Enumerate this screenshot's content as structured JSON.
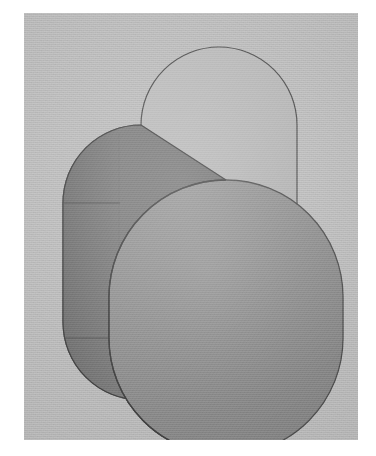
{
  "figure": {
    "shape_name": "stadium-prism",
    "projection": "axonometric",
    "canvas": {
      "width": 376,
      "height": 456
    },
    "page_background": "#ffffff",
    "plate": {
      "name": "scan-plate",
      "left": 24,
      "top": 13,
      "width": 334,
      "height": 427,
      "background_color": "#bdbdbd"
    },
    "faces": [
      {
        "id": "top-back-face",
        "label": "Back / top stadium face",
        "fill": "#b4b4b4",
        "stroke": "#4a4a4a",
        "stroke_width": 1.2
      },
      {
        "id": "side-face",
        "label": "Extruded side wall",
        "fill": "#757575",
        "stroke": "#3e3e3e",
        "stroke_width": 1.2
      },
      {
        "id": "front-face",
        "label": "Front stadium face",
        "fill": "#8a8a8a",
        "stroke": "#464646",
        "stroke_width": 1.3
      }
    ],
    "seams": [
      {
        "id": "upper-tangent-seam",
        "label": "Upper arc-to-straight tangent line",
        "stroke": "#4f4f4f"
      },
      {
        "id": "lower-tangent-seam",
        "label": "Lower arc-to-straight tangent line",
        "stroke": "#4f4f4f"
      },
      {
        "id": "silhouette-seam",
        "label": "Silhouette edge between side wall and front face",
        "stroke": "#3f3f3f"
      }
    ],
    "geometry": {
      "front_face": {
        "center_x": 196,
        "center_y": 245,
        "half_width": 117,
        "half_height": 195,
        "corner_radius": 117
      },
      "depth_offset": {
        "dx": -85,
        "dy": -55
      },
      "tangent_y_upper": 190,
      "tangent_y_lower": 325
    },
    "palette": {
      "paper_white": "#ffffff",
      "plate_gray": "#bdbdbd",
      "top_face_gray": "#b4b4b4",
      "side_face_gray": "#757575",
      "front_face_gray": "#8a8a8a",
      "outline_dark": "#444444"
    }
  }
}
